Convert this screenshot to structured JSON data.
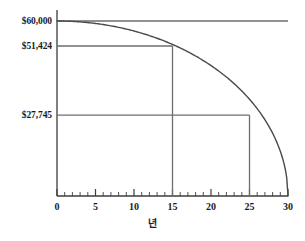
{
  "chart_data": {
    "type": "line",
    "title": "",
    "subtitle": "",
    "xlabel": "년",
    "ylabel": "",
    "xlim": [
      0,
      30
    ],
    "ylim": [
      0,
      60000
    ],
    "grid": false,
    "legend": null,
    "x_ticks": [
      0,
      5,
      10,
      15,
      20,
      25,
      30
    ],
    "x_tick_labels": [
      "0",
      "5",
      "10",
      "15",
      "20",
      "25",
      "30"
    ],
    "x_minor_tick_step": 1,
    "y_tick_labels": [
      "$60,000",
      "$51,424",
      "$27,745"
    ],
    "y_tick_values": [
      60000,
      51424,
      27745
    ],
    "series": [
      {
        "name": "balance",
        "x": [
          0,
          1,
          2,
          3,
          4,
          5,
          6,
          7,
          8,
          9,
          10,
          11,
          12,
          13,
          14,
          15,
          16,
          17,
          18,
          19,
          20,
          21,
          22,
          23,
          24,
          25,
          26,
          27,
          28,
          29,
          30
        ],
        "values": [
          60000,
          59967,
          59866,
          59699,
          59464,
          59161,
          58788,
          58345,
          57831,
          57244,
          56584,
          55848,
          55036,
          54143,
          53169,
          51424,
          50945,
          49693,
          48332,
          46855,
          45255,
          43521,
          41641,
          39598,
          37373,
          27745,
          32268,
          29326,
          25981,
          22029,
          0
        ]
      }
    ],
    "annotations": [
      {
        "name": "reference-15-years",
        "x": 15,
        "y": 51424,
        "label": "$51,424",
        "horizontal_line_from_x": 0,
        "vertical_line_to_y": 0
      },
      {
        "name": "reference-25-years",
        "x": 25,
        "y": 27745,
        "label": "$27,745",
        "horizontal_line_from_x": 0,
        "vertical_line_to_y": 0
      },
      {
        "name": "reference-start",
        "x": 0,
        "y": 60000,
        "label": "$60,000",
        "horizontal_line_from_x": 0,
        "vertical_line_to_y": null
      }
    ],
    "colors": {
      "curve": "#4a4a4a",
      "axis": "#3d3d3d",
      "reference_line": "#6e6e6e",
      "text": "#1b1b1b",
      "background": "#ffffff"
    }
  }
}
